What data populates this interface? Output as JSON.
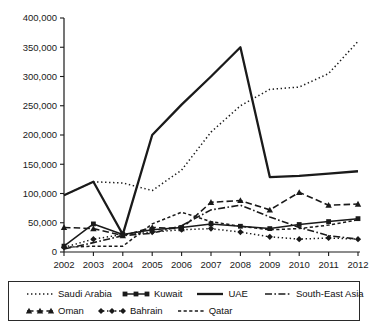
{
  "chart_data": {
    "type": "line",
    "title": "",
    "xlabel": "",
    "ylabel": "",
    "categories": [
      "2002",
      "2003",
      "2004",
      "2005",
      "2006",
      "2007",
      "2008",
      "2009",
      "2010",
      "2011",
      "2012"
    ],
    "x": [
      2002,
      2003,
      2004,
      2005,
      2006,
      2007,
      2008,
      2009,
      2010,
      2011,
      2012
    ],
    "ylim": [
      0,
      400000
    ],
    "ytick_values": [
      0,
      50000,
      100000,
      150000,
      200000,
      250000,
      300000,
      350000,
      400000
    ],
    "ytick_labels": [
      "0",
      "50,000",
      "100,000",
      "150,000",
      "200,000",
      "250,000",
      "300,000",
      "350,000",
      "400,000"
    ],
    "grid": false,
    "legend_position": "bottom",
    "series": [
      {
        "name": "Saudi Arabia",
        "style": "dotted",
        "marker": "none",
        "values": [
          97000,
          120000,
          118000,
          105000,
          140000,
          205000,
          250000,
          278000,
          282000,
          305000,
          360000
        ]
      },
      {
        "name": "Kuwait",
        "style": "solid",
        "marker": "square",
        "values": [
          10000,
          48000,
          30000,
          38000,
          42000,
          48000,
          44000,
          40000,
          47000,
          52000,
          57000
        ]
      },
      {
        "name": "UAE",
        "style": "solid-thick",
        "marker": "none",
        "values": [
          97000,
          120000,
          30000,
          200000,
          252000,
          300000,
          350000,
          128000,
          130000,
          134000,
          138000
        ]
      },
      {
        "name": "South-East Asia",
        "style": "dashdot",
        "marker": "none",
        "values": [
          5000,
          16000,
          28000,
          32000,
          45000,
          72000,
          80000,
          60000,
          42000,
          28000,
          22000
        ]
      },
      {
        "name": "Oman",
        "style": "dashed",
        "marker": "triangle",
        "values": [
          42000,
          40000,
          28000,
          42000,
          40000,
          85000,
          88000,
          72000,
          102000,
          80000,
          82000
        ]
      },
      {
        "name": "Bahrain",
        "style": "dotted",
        "marker": "diamond",
        "values": [
          8000,
          22000,
          30000,
          34000,
          38000,
          40000,
          34000,
          26000,
          22000,
          24000,
          22000
        ]
      },
      {
        "name": "Qatar",
        "style": "dashed-fine",
        "marker": "none",
        "values": [
          8000,
          10000,
          10000,
          48000,
          68000,
          52000,
          44000,
          38000,
          40000,
          46000,
          55000
        ]
      }
    ]
  },
  "legend": {
    "rows": [
      [
        {
          "label": "Saudi Arabia",
          "key": "saudi-arabia"
        },
        {
          "label": "Kuwait",
          "key": "kuwait"
        },
        {
          "label": "UAE",
          "key": "uae"
        },
        {
          "label": "South-East Asia",
          "key": "south-east-asia"
        }
      ],
      [
        {
          "label": "Oman",
          "key": "oman"
        },
        {
          "label": "Bahrain",
          "key": "bahrain"
        },
        {
          "label": "Qatar",
          "key": "qatar"
        }
      ]
    ]
  },
  "colors": {
    "ink": "#1a1a1a",
    "background": "#ffffff"
  }
}
